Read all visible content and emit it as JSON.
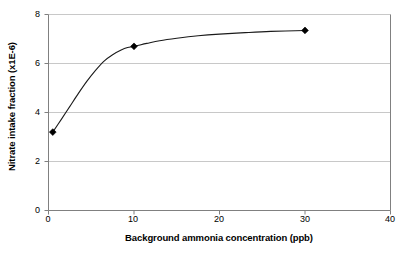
{
  "chart_data": {
    "type": "line",
    "title": "",
    "subtitle": "",
    "xlabel": "Background ammonia concentration (ppb)",
    "ylabel": "Nitrate intake fraction (x1E-6)",
    "xlim": [
      0,
      40
    ],
    "ylim": [
      0,
      8
    ],
    "xticks": [
      0,
      10,
      20,
      30,
      40
    ],
    "yticks": [
      0,
      2,
      4,
      6,
      8
    ],
    "xtick_labels": [
      "0",
      "10",
      "20",
      "30",
      "40"
    ],
    "ytick_labels": [
      "0",
      "2",
      "4",
      "6",
      "8"
    ],
    "grid": "horizontal",
    "legend": "none",
    "marker": "diamond",
    "marker_color": "#000000",
    "line_color": "#1a1a1a",
    "gridline_color": "#c8c8c8",
    "axis_color": "#808080",
    "background_color": "#ffffff",
    "series": [
      {
        "name": "Nitrate intake fraction",
        "x": [
          0.5,
          10,
          30
        ],
        "y": [
          3.2,
          6.7,
          7.35
        ]
      }
    ],
    "curve_points": [
      [
        0.5,
        3.2
      ],
      [
        1.5,
        3.72
      ],
      [
        2.5,
        4.25
      ],
      [
        3.5,
        4.78
      ],
      [
        4.5,
        5.28
      ],
      [
        5.5,
        5.72
      ],
      [
        6.5,
        6.1
      ],
      [
        7.5,
        6.36
      ],
      [
        8.5,
        6.55
      ],
      [
        9.25,
        6.65
      ],
      [
        10,
        6.7
      ],
      [
        11.5,
        6.82
      ],
      [
        13,
        6.93
      ],
      [
        15,
        7.03
      ],
      [
        17.5,
        7.13
      ],
      [
        20,
        7.2
      ],
      [
        23,
        7.26
      ],
      [
        26,
        7.31
      ],
      [
        30,
        7.35
      ]
    ]
  },
  "axes": {
    "x_title": "Background ammonia concentration (ppb)",
    "y_title": "Nitrate intake fraction (x1E-6)"
  }
}
